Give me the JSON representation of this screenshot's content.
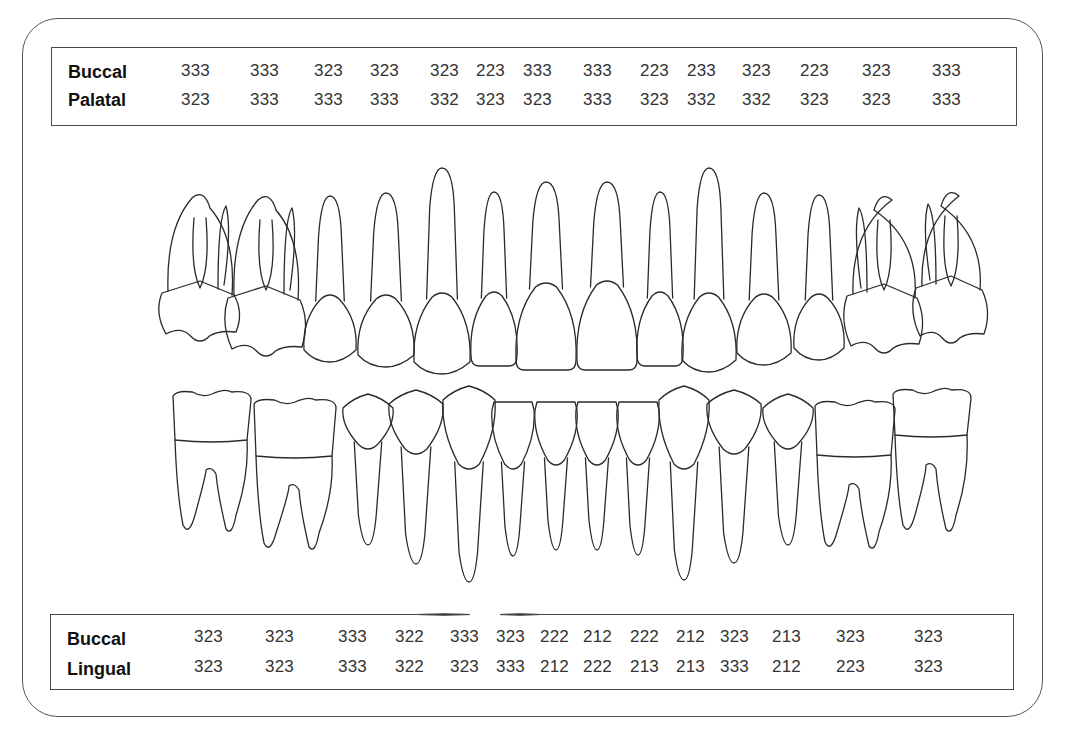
{
  "upper_table": {
    "rows": [
      {
        "label": "Buccal",
        "values": [
          "333",
          "333",
          "323",
          "323",
          "323",
          "223",
          "333",
          "333",
          "223",
          "233",
          "323",
          "223",
          "323",
          "333"
        ]
      },
      {
        "label": "Palatal",
        "values": [
          "323",
          "333",
          "333",
          "333",
          "332",
          "323",
          "323",
          "333",
          "323",
          "332",
          "332",
          "323",
          "323",
          "333"
        ]
      }
    ],
    "column_x": [
      181,
      250,
      314,
      370,
      430,
      476,
      523,
      583,
      640,
      687,
      742,
      800,
      862,
      932
    ]
  },
  "lower_table": {
    "rows": [
      {
        "label": "Buccal",
        "values": [
          "323",
          "323",
          "333",
          "322",
          "333",
          "323",
          "222",
          "212",
          "222",
          "212",
          "323",
          "213",
          "323",
          "323"
        ]
      },
      {
        "label": "Lingual",
        "values": [
          "323",
          "323",
          "333",
          "322",
          "323",
          "333",
          "212",
          "222",
          "213",
          "213",
          "333",
          "212",
          "223",
          "323"
        ]
      }
    ],
    "column_x": [
      194,
      265,
      338,
      395,
      450,
      496,
      540,
      583,
      630,
      676,
      720,
      772,
      836,
      914
    ]
  },
  "diagram": {
    "upper_arch": [
      {
        "type": "molar",
        "cx": 200,
        "w": 76,
        "crown_top": 285,
        "crown_bottom": 340,
        "root_top": 188,
        "mirror": false
      },
      {
        "type": "molar",
        "cx": 266,
        "w": 76,
        "crown_top": 290,
        "crown_bottom": 355,
        "root_top": 190,
        "mirror": false
      },
      {
        "type": "premolar",
        "cx": 330,
        "w": 52,
        "crown_top": 297,
        "crown_bottom": 360,
        "root_top": 196
      },
      {
        "type": "premolar",
        "cx": 386,
        "w": 56,
        "crown_top": 297,
        "crown_bottom": 365,
        "root_top": 193
      },
      {
        "type": "canine",
        "cx": 442,
        "w": 56,
        "crown_top": 295,
        "crown_bottom": 372,
        "root_top": 168
      },
      {
        "type": "incisor",
        "cx": 494,
        "w": 46,
        "crown_top": 294,
        "crown_bottom": 366,
        "root_top": 192
      },
      {
        "type": "incisor",
        "cx": 546,
        "w": 60,
        "crown_top": 285,
        "crown_bottom": 370,
        "root_top": 182
      },
      {
        "type": "incisor",
        "cx": 607,
        "w": 60,
        "crown_top": 283,
        "crown_bottom": 370,
        "root_top": 182
      },
      {
        "type": "incisor",
        "cx": 660,
        "w": 46,
        "crown_top": 294,
        "crown_bottom": 366,
        "root_top": 192
      },
      {
        "type": "canine",
        "cx": 709,
        "w": 54,
        "crown_top": 295,
        "crown_bottom": 370,
        "root_top": 168
      },
      {
        "type": "premolar",
        "cx": 764,
        "w": 54,
        "crown_top": 296,
        "crown_bottom": 363,
        "root_top": 193
      },
      {
        "type": "premolar",
        "cx": 819,
        "w": 50,
        "crown_top": 296,
        "crown_bottom": 358,
        "root_top": 195
      },
      {
        "type": "molar",
        "cx": 884,
        "w": 74,
        "crown_top": 288,
        "crown_bottom": 352,
        "root_top": 190,
        "mirror": true
      },
      {
        "type": "molar",
        "cx": 951,
        "w": 70,
        "crown_top": 280,
        "crown_bottom": 342,
        "root_top": 186,
        "mirror": true
      }
    ],
    "lower_arch": [
      {
        "type": "molar",
        "cx": 212,
        "w": 78,
        "crown_top": 390,
        "crown_bottom": 440,
        "root_bottom": 535,
        "mirror": false
      },
      {
        "type": "molar",
        "cx": 295,
        "w": 82,
        "crown_top": 398,
        "crown_bottom": 456,
        "root_bottom": 553,
        "mirror": false
      },
      {
        "type": "premolar",
        "cx": 368,
        "w": 50,
        "crown_top": 400,
        "crown_bottom": 450,
        "root_bottom": 545
      },
      {
        "type": "premolar",
        "cx": 416,
        "w": 54,
        "crown_top": 396,
        "crown_bottom": 455,
        "root_bottom": 564
      },
      {
        "type": "canine",
        "cx": 469,
        "w": 52,
        "crown_top": 392,
        "crown_bottom": 470,
        "root_bottom": 582
      },
      {
        "type": "incisor",
        "cx": 513,
        "w": 42,
        "crown_top": 402,
        "crown_bottom": 470,
        "root_bottom": 556
      },
      {
        "type": "incisor",
        "cx": 556,
        "w": 42,
        "crown_top": 402,
        "crown_bottom": 466,
        "root_bottom": 550
      },
      {
        "type": "incisor",
        "cx": 597,
        "w": 42,
        "crown_top": 402,
        "crown_bottom": 466,
        "root_bottom": 550
      },
      {
        "type": "incisor",
        "cx": 638,
        "w": 42,
        "crown_top": 402,
        "crown_bottom": 466,
        "root_bottom": 555
      },
      {
        "type": "canine",
        "cx": 684,
        "w": 50,
        "crown_top": 392,
        "crown_bottom": 470,
        "root_bottom": 580
      },
      {
        "type": "premolar",
        "cx": 734,
        "w": 54,
        "crown_top": 396,
        "crown_bottom": 455,
        "root_bottom": 563
      },
      {
        "type": "premolar",
        "cx": 788,
        "w": 50,
        "crown_top": 400,
        "crown_bottom": 450,
        "root_bottom": 545
      },
      {
        "type": "molar",
        "cx": 855,
        "w": 80,
        "crown_top": 400,
        "crown_bottom": 455,
        "root_bottom": 552,
        "mirror": true
      },
      {
        "type": "molar",
        "cx": 932,
        "w": 78,
        "crown_top": 388,
        "crown_bottom": 435,
        "root_bottom": 535,
        "mirror": true
      }
    ]
  },
  "colors": {
    "line": "#2a2a2a",
    "text": "#333333",
    "label": "#111111",
    "background": "#ffffff"
  }
}
